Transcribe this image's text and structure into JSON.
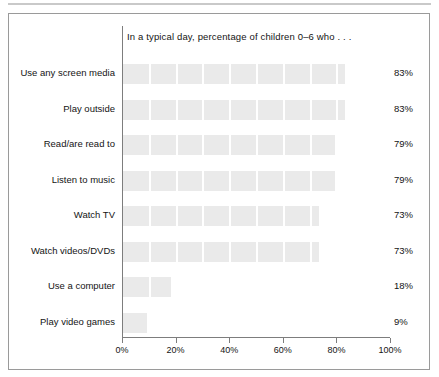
{
  "figure": {
    "frame_border_color": "#9a9a9a",
    "rule_color": "#c9c9c9"
  },
  "chart_data": {
    "type": "bar",
    "orientation": "horizontal",
    "title": "In a typical day, percentage of children 0–6 who . . .",
    "xlabel": "",
    "ylabel": "",
    "xlim": [
      0,
      100
    ],
    "grid": "vertical-white-separators",
    "legend": "none",
    "bar_color": "#eaeaea",
    "value_suffix": "%",
    "categories": [
      "Use any screen media",
      "Play outside",
      "Read/are read to",
      "Listen to music",
      "Watch TV",
      "Watch videos/DVDs",
      "Use a computer",
      "Play video games"
    ],
    "values": [
      83,
      83,
      79,
      79,
      73,
      73,
      18,
      9
    ],
    "value_labels": [
      "83%",
      "83%",
      "79%",
      "79%",
      "73%",
      "73%",
      "18%",
      "9%"
    ],
    "xticks": [
      0,
      20,
      40,
      60,
      80,
      100
    ],
    "xtick_labels": [
      "0%",
      "20%",
      "40%",
      "60%",
      "80%",
      "100%"
    ]
  }
}
